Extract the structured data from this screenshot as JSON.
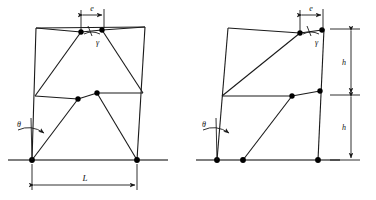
{
  "figure": {
    "type": "engineering-diagram",
    "line_color": "#1a1a1a",
    "node_color": "#000000",
    "ground_color": "#555555"
  },
  "labels": {
    "eccentricity": "e",
    "gamma": "γ",
    "theta": "θ",
    "span": "L",
    "storey_height_upper": "h",
    "storey_height_lower": "h"
  },
  "panels": [
    {
      "name": "left-frame",
      "ground": {
        "x1": 8,
        "x2": 168,
        "y": 160
      },
      "supports": [
        {
          "id": "L-base-left",
          "x": 32,
          "y": 160
        },
        {
          "id": "L-base-right",
          "x": 137,
          "y": 160
        }
      ],
      "nodes": [
        {
          "id": "L-top-beam-left",
          "x": 81,
          "y": 32
        },
        {
          "id": "L-top-beam-right",
          "x": 102,
          "y": 30
        },
        {
          "id": "L-mid-left",
          "x": 78,
          "y": 99
        },
        {
          "id": "L-mid-right",
          "x": 97,
          "y": 93
        }
      ],
      "columns": [
        {
          "id": "L-col-left",
          "x1": 32,
          "y1": 160,
          "x2": 36,
          "y2": 28
        },
        {
          "id": "L-col-right",
          "x1": 137,
          "y1": 160,
          "x2": 145,
          "y2": 27
        }
      ],
      "beams": [
        {
          "id": "L-beam-top",
          "x1": 36,
          "y1": 28,
          "x2": 145,
          "y2": 27
        },
        {
          "id": "L-beam-middle",
          "x1": 35,
          "y1": 96,
          "x2": 143,
          "y2": 93
        }
      ],
      "braces": [
        {
          "id": "L-brace-upper-left",
          "x1": 35,
          "y1": 96,
          "x2": 81,
          "y2": 32
        },
        {
          "id": "L-brace-upper-right",
          "x1": 143,
          "y1": 93,
          "x2": 102,
          "y2": 30
        },
        {
          "id": "L-brace-lower-left",
          "x1": 32,
          "y1": 160,
          "x2": 78,
          "y2": 99
        },
        {
          "id": "L-brace-lower-right",
          "x1": 137,
          "y1": 160,
          "x2": 97,
          "y2": 93
        }
      ],
      "dimension_e": {
        "x1": 81,
        "x2": 104,
        "y": 14
      },
      "dimension_L": {
        "x1": 32,
        "x2": 137,
        "y": 185
      },
      "theta_marker": {
        "x": 22,
        "y": 128
      }
    },
    {
      "name": "right-frame",
      "ground": {
        "x1": 196,
        "x2": 340,
        "y": 160
      },
      "supports": [
        {
          "id": "R-base-left",
          "x": 217,
          "y": 160
        },
        {
          "id": "R-base-brace",
          "x": 243,
          "y": 160
        },
        {
          "id": "R-base-right",
          "x": 318,
          "y": 160
        }
      ],
      "nodes": [
        {
          "id": "R-top-beam-left",
          "x": 300,
          "y": 33
        },
        {
          "id": "R-top-beam-right",
          "x": 322,
          "y": 30
        },
        {
          "id": "R-mid-left",
          "x": 292,
          "y": 96
        },
        {
          "id": "R-mid-right",
          "x": 320,
          "y": 92
        }
      ],
      "columns": [
        {
          "id": "R-col-left",
          "x1": 217,
          "y1": 160,
          "x2": 228,
          "y2": 28
        },
        {
          "id": "R-col-right",
          "x1": 318,
          "y1": 160,
          "x2": 324,
          "y2": 29
        }
      ],
      "beams": [
        {
          "id": "R-beam-top",
          "x1": 228,
          "y1": 28,
          "x2": 324,
          "y2": 29
        },
        {
          "id": "R-beam-middle",
          "x1": 222,
          "y1": 96,
          "x2": 322,
          "y2": 91
        }
      ],
      "braces": [
        {
          "id": "R-brace-upper",
          "x1": 222,
          "y1": 96,
          "x2": 300,
          "y2": 33
        },
        {
          "id": "R-brace-lower",
          "x1": 243,
          "y1": 160,
          "x2": 292,
          "y2": 96
        }
      ],
      "dimension_e": {
        "x1": 300,
        "x2": 323,
        "y": 14
      },
      "theta_marker": {
        "x": 207,
        "y": 128
      },
      "dimension_h_upper": {
        "x": 348,
        "y1": 29,
        "y2": 96
      },
      "dimension_h_lower": {
        "x": 348,
        "y1": 96,
        "y2": 160
      }
    }
  ]
}
